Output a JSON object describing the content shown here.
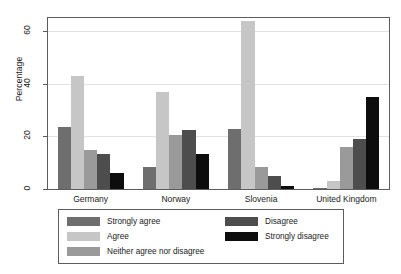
{
  "chart_data": {
    "type": "bar",
    "title": "",
    "xlabel": "",
    "ylabel": "Percentage",
    "ylim": [
      0,
      65
    ],
    "yticks": [
      0,
      20,
      40,
      60
    ],
    "ytick_labels": [
      "0",
      "20",
      "40",
      "60"
    ],
    "grid": true,
    "legend_position": "below",
    "categories": [
      "Germany",
      "Norway",
      "Slovenia",
      "United Kingdom"
    ],
    "series": [
      {
        "name": "Strongly agree",
        "color": "#6e6e6e",
        "values": [
          23.5,
          8.5,
          23.0,
          0.5
        ]
      },
      {
        "name": "Agree",
        "color": "#c6c6c6",
        "values": [
          43.0,
          37.0,
          64.0,
          3.0
        ]
      },
      {
        "name": "Neither agree nor disagree",
        "color": "#9a9a9a",
        "values": [
          15.0,
          20.5,
          8.5,
          16.0
        ]
      },
      {
        "name": "Disagree",
        "color": "#4d4d4d",
        "values": [
          13.5,
          22.5,
          5.0,
          19.0
        ]
      },
      {
        "name": "Strongly disagree",
        "color": "#0d0d0d",
        "values": [
          6.0,
          13.5,
          1.0,
          35.0
        ]
      }
    ],
    "extra_series_note": ""
  },
  "axes": {
    "y_title": "Percentage",
    "y_ticks": [
      "0",
      "20",
      "40",
      "60"
    ],
    "x_categories": [
      "Germany",
      "Norway",
      "Slovenia",
      "United Kingdom"
    ]
  },
  "legend": {
    "entries": [
      {
        "label": "Strongly agree",
        "color": "#6e6e6e"
      },
      {
        "label": "Agree",
        "color": "#c6c6c6"
      },
      {
        "label": "Neither agree nor disagree",
        "color": "#9a9a9a"
      },
      {
        "label": "Disagree",
        "color": "#4d4d4d"
      },
      {
        "label": "Strongly disagree",
        "color": "#0d0d0d"
      }
    ]
  }
}
